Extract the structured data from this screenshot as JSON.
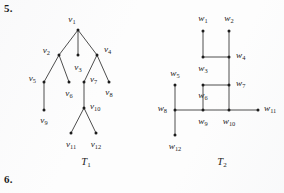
{
  "page": {
    "problem_numbers": [
      {
        "id": "prob-5",
        "label": "5."
      },
      {
        "id": "prob-6",
        "label": "6."
      }
    ],
    "background_color": "#fdfdfd",
    "ink_color": "#2b2b2b"
  },
  "figures": [
    {
      "name": "T1",
      "caption_base": "T",
      "caption_sub": "1",
      "caption_x": 86,
      "caption_y": 165,
      "layout": "rooted-tree",
      "nodes": [
        {
          "id": "v1",
          "base": "v",
          "sub": "1",
          "x": 78,
          "y": 30,
          "lx": 72,
          "ly": 22,
          "anchor": "middle"
        },
        {
          "id": "v2",
          "base": "v",
          "sub": "2",
          "x": 59,
          "y": 55,
          "lx": 50,
          "ly": 53,
          "anchor": "end"
        },
        {
          "id": "v3",
          "base": "v",
          "sub": "3",
          "x": 78,
          "y": 55,
          "lx": 78,
          "ly": 70,
          "anchor": "middle"
        },
        {
          "id": "v4",
          "base": "v",
          "sub": "4",
          "x": 97,
          "y": 55,
          "lx": 104,
          "ly": 52,
          "anchor": "start"
        },
        {
          "id": "v5",
          "base": "v",
          "sub": "5",
          "x": 44,
          "y": 82,
          "lx": 36,
          "ly": 81,
          "anchor": "end"
        },
        {
          "id": "v6",
          "base": "v",
          "sub": "6",
          "x": 69,
          "y": 82,
          "lx": 69,
          "ly": 96,
          "anchor": "middle"
        },
        {
          "id": "v7",
          "base": "v",
          "sub": "7",
          "x": 84,
          "y": 82,
          "lx": 90,
          "ly": 82,
          "anchor": "start"
        },
        {
          "id": "v8",
          "base": "v",
          "sub": "8",
          "x": 109,
          "y": 82,
          "lx": 109,
          "ly": 95,
          "anchor": "middle"
        },
        {
          "id": "v9",
          "base": "v",
          "sub": "9",
          "x": 44,
          "y": 110,
          "lx": 44,
          "ly": 123,
          "anchor": "middle"
        },
        {
          "id": "v10",
          "base": "v",
          "sub": "10",
          "x": 84,
          "y": 108,
          "lx": 90,
          "ly": 109,
          "anchor": "start"
        },
        {
          "id": "v11",
          "base": "v",
          "sub": "11",
          "x": 71,
          "y": 133,
          "lx": 71,
          "ly": 147,
          "anchor": "middle"
        },
        {
          "id": "v12",
          "base": "v",
          "sub": "12",
          "x": 96,
          "y": 133,
          "lx": 96,
          "ly": 147,
          "anchor": "middle"
        }
      ],
      "edges": [
        {
          "from": "v1",
          "to": "v2"
        },
        {
          "from": "v1",
          "to": "v3"
        },
        {
          "from": "v1",
          "to": "v4"
        },
        {
          "from": "v2",
          "to": "v5"
        },
        {
          "from": "v2",
          "to": "v6"
        },
        {
          "from": "v4",
          "to": "v7"
        },
        {
          "from": "v4",
          "to": "v8"
        },
        {
          "from": "v5",
          "to": "v9"
        },
        {
          "from": "v7",
          "to": "v10"
        },
        {
          "from": "v10",
          "to": "v11"
        },
        {
          "from": "v10",
          "to": "v12"
        }
      ]
    },
    {
      "name": "T2",
      "caption_base": "T",
      "caption_sub": "2",
      "caption_x": 222,
      "caption_y": 165,
      "layout": "orthogonal-grid",
      "nodes": [
        {
          "id": "w1",
          "base": "w",
          "sub": "1",
          "x": 203,
          "y": 31,
          "lx": 203,
          "ly": 21,
          "anchor": "middle"
        },
        {
          "id": "w2",
          "base": "w",
          "sub": "2",
          "x": 229,
          "y": 31,
          "lx": 229,
          "ly": 21,
          "anchor": "middle"
        },
        {
          "id": "w3",
          "base": "w",
          "sub": "3",
          "x": 203,
          "y": 57,
          "lx": 203,
          "ly": 71,
          "anchor": "middle"
        },
        {
          "id": "w4",
          "base": "w",
          "sub": "4",
          "x": 229,
          "y": 57,
          "lx": 236,
          "ly": 58,
          "anchor": "start"
        },
        {
          "id": "w5",
          "base": "w",
          "sub": "5",
          "x": 175,
          "y": 85,
          "lx": 175,
          "ly": 76,
          "anchor": "middle"
        },
        {
          "id": "w6",
          "base": "w",
          "sub": "6",
          "x": 203,
          "y": 85,
          "lx": 203,
          "ly": 98,
          "anchor": "middle"
        },
        {
          "id": "w7",
          "base": "w",
          "sub": "7",
          "x": 229,
          "y": 85,
          "lx": 236,
          "ly": 86,
          "anchor": "start"
        },
        {
          "id": "w8",
          "base": "w",
          "sub": "8",
          "x": 175,
          "y": 110,
          "lx": 167,
          "ly": 111,
          "anchor": "end"
        },
        {
          "id": "w9",
          "base": "w",
          "sub": "9",
          "x": 203,
          "y": 110,
          "lx": 203,
          "ly": 124,
          "anchor": "middle"
        },
        {
          "id": "w10",
          "base": "w",
          "sub": "10",
          "x": 229,
          "y": 110,
          "lx": 229,
          "ly": 124,
          "anchor": "middle"
        },
        {
          "id": "w11",
          "base": "w",
          "sub": "11",
          "x": 258,
          "y": 110,
          "lx": 264,
          "ly": 111,
          "anchor": "start"
        },
        {
          "id": "w12",
          "base": "w",
          "sub": "12",
          "x": 175,
          "y": 135,
          "lx": 175,
          "ly": 149,
          "anchor": "middle"
        }
      ],
      "edges": [
        {
          "from": "w1",
          "to": "w3"
        },
        {
          "from": "w2",
          "to": "w4"
        },
        {
          "from": "w3",
          "to": "w4"
        },
        {
          "from": "w4",
          "to": "w7"
        },
        {
          "from": "w6",
          "to": "w7"
        },
        {
          "from": "w7",
          "to": "w10"
        },
        {
          "from": "w5",
          "to": "w8"
        },
        {
          "from": "w6",
          "to": "w9"
        },
        {
          "from": "w8",
          "to": "w9"
        },
        {
          "from": "w9",
          "to": "w10"
        },
        {
          "from": "w10",
          "to": "w11"
        },
        {
          "from": "w8",
          "to": "w12"
        }
      ]
    }
  ]
}
